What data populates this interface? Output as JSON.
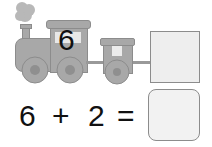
{
  "train": {
    "engine_number": "6",
    "car_count": 1,
    "box_label": ""
  },
  "equation": {
    "left": "6",
    "operator": "+",
    "right": "2",
    "equals": "=",
    "answer": ""
  },
  "colors": {
    "train_fill": "#a8a8a8",
    "train_stroke": "#8c8c8c",
    "wheel_hub": "#8f8f8f",
    "box_fill": "#eeeeee",
    "answer_fill": "#f2f2f2",
    "smoke": "#b5b5b5"
  }
}
